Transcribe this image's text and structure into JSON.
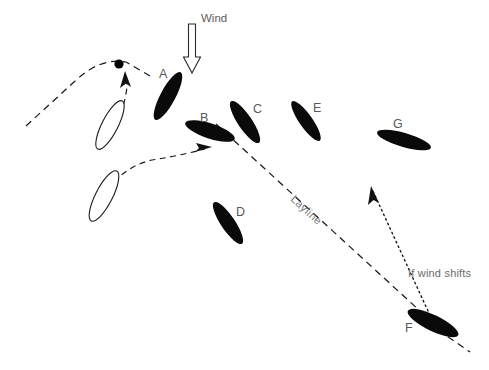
{
  "diagram": {
    "background_color": "#ffffff",
    "ink_color": "#0a0a0a",
    "label_color": "#58585a",
    "width": 489,
    "height": 370,
    "annotations": {
      "wind_label": "Wind",
      "layline_label": "Layline",
      "wind_shift_label": "If wind shifts"
    },
    "boats": [
      {
        "id": "A",
        "label": "A",
        "style": "filled",
        "cx": 168,
        "cy": 95,
        "rx": 27,
        "ry": 7.5,
        "angle": -62,
        "label_x": 163,
        "label_y": 74
      },
      {
        "id": "B",
        "label": "B",
        "style": "filled",
        "cx": 210,
        "cy": 131,
        "rx": 26,
        "ry": 7.5,
        "angle": 18,
        "label_x": 203,
        "label_y": 120
      },
      {
        "id": "C",
        "label": "C",
        "style": "filled",
        "cx": 245,
        "cy": 122,
        "rx": 25,
        "ry": 7,
        "angle": 56,
        "label_x": 255,
        "label_y": 110
      },
      {
        "id": "D",
        "label": "D",
        "style": "filled",
        "cx": 228,
        "cy": 222,
        "rx": 25,
        "ry": 7,
        "angle": 56,
        "label_x": 238,
        "label_y": 214
      },
      {
        "id": "E",
        "label": "E",
        "style": "filled",
        "cx": 306,
        "cy": 120,
        "rx": 24,
        "ry": 6.5,
        "angle": 55,
        "label_x": 316,
        "label_y": 110
      },
      {
        "id": "F",
        "label": "F",
        "style": "filled",
        "cx": 432,
        "cy": 322,
        "rx": 28,
        "ry": 8,
        "angle": 26,
        "label_x": 410,
        "label_y": 330
      },
      {
        "id": "G",
        "label": "G",
        "style": "filled",
        "cx": 404,
        "cy": 140,
        "rx": 27,
        "ry": 7,
        "angle": 18,
        "label_x": 396,
        "label_y": 126
      },
      {
        "id": "ghost-upper",
        "label": "",
        "style": "open",
        "cx": 110,
        "cy": 125,
        "rx": 26,
        "ry": 8,
        "angle": -63,
        "label_x": 0,
        "label_y": 0
      },
      {
        "id": "ghost-lower",
        "label": "",
        "style": "open",
        "cx": 104,
        "cy": 196,
        "rx": 27,
        "ry": 8,
        "angle": -63,
        "label_x": 0,
        "label_y": 0
      }
    ],
    "mark": {
      "name": "windward-mark",
      "cx": 119,
      "cy": 64,
      "r": 4.6
    },
    "paths": {
      "layline": {
        "x1": 216,
        "y1": 124,
        "x2": 432,
        "y2": 322
      },
      "mark_approach_left": "M 26,126 L 74,82 Q 100,57 126,62 L 150,76",
      "tack_curve_to_mark": "M 117,125 Q 126,100 127,86 L 126,74",
      "tack_curve_to_B": "M 114,182 Q 130,165 152,160 Q 178,156 205,149",
      "wind_shift_dotted": "M 428,311 L 372,189",
      "layline_tail": "M 438,330 L 470,352"
    },
    "wind_arrow": {
      "x": 192,
      "y_top": 22,
      "y_bottom": 72,
      "label_x": 203,
      "label_y": 21
    },
    "footer_note": ""
  }
}
